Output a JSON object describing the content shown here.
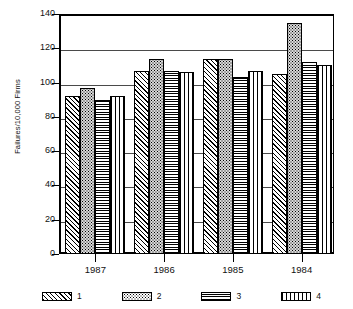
{
  "chart_data": {
    "type": "bar",
    "title": "",
    "xlabel": "",
    "ylabel": "Failures/10,000 Firms",
    "categories": [
      "1987",
      "1986",
      "1985",
      "1984"
    ],
    "ylim": [
      0,
      140
    ],
    "yticks": [
      0,
      20,
      40,
      60,
      80,
      100,
      120,
      140
    ],
    "ytick_labels": [
      "0",
      "20",
      "40",
      "60",
      "80",
      "100",
      "120",
      "140"
    ],
    "grid": true,
    "grid_axis": "y",
    "legend_position": "bottom",
    "series": [
      {
        "name": "1",
        "pattern": "diagonal-hatch",
        "values": [
          92,
          107,
          114,
          105
        ]
      },
      {
        "name": "2",
        "pattern": "stipple-dots",
        "values": [
          97,
          114,
          114,
          135
        ]
      },
      {
        "name": "3",
        "pattern": "cross-hatch",
        "values": [
          90,
          107,
          103,
          112
        ]
      },
      {
        "name": "4",
        "pattern": "vertical-lines",
        "values": [
          92,
          106,
          107,
          110
        ]
      }
    ]
  },
  "legend": {
    "items": [
      {
        "label": "1",
        "swatch": "diagonal-hatch-swatch"
      },
      {
        "label": "2",
        "swatch": "stipple-dots-swatch"
      },
      {
        "label": "3",
        "swatch": "cross-hatch-swatch"
      },
      {
        "label": "4",
        "swatch": "vertical-lines-swatch"
      }
    ]
  },
  "colors": {
    "axis": "#000000",
    "gridline": "#4a4a4a",
    "background": "#ffffff",
    "text": "#111111"
  }
}
